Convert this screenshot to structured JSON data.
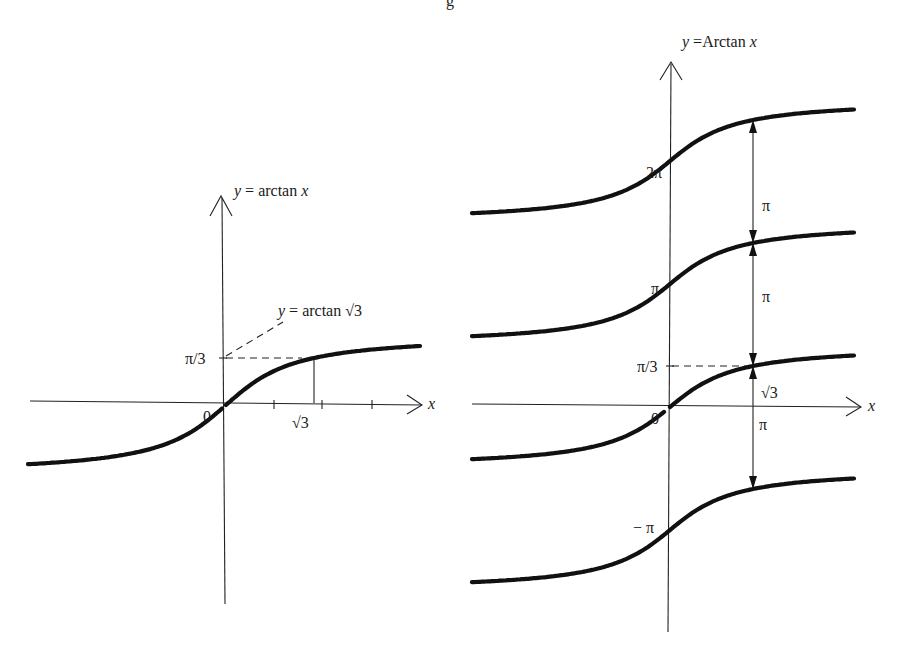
{
  "figure": {
    "top_caption_fragment": "g",
    "left_panel": {
      "function_label_y": "y",
      "function_label_eq": " = arctan ",
      "function_label_x": "x",
      "x_axis_label": "x",
      "origin_label": "0",
      "y_tick_label": "π/3",
      "x_tick_label": "√3",
      "annotation_y": "y",
      "annotation_eq": " = arctan ",
      "annotation_arg": "√3",
      "x_ticks_count": 3
    },
    "right_panel": {
      "function_label_y": "y",
      "function_label_eq": " =Arctan ",
      "function_label_x": "x",
      "x_axis_label": "x",
      "origin_label": "0",
      "y_labels": {
        "two_pi": "2π",
        "pi": "π",
        "pi_over_3": "π/3",
        "minus_pi": "− π"
      },
      "x_mark_label": "√3",
      "gap_labels": [
        "π",
        "π",
        "π"
      ],
      "branch_offsets": [
        -1,
        0,
        1,
        2
      ]
    }
  }
}
